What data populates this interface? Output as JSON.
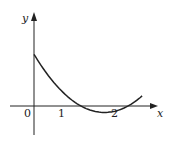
{
  "chart_data": {
    "type": "line",
    "title": "",
    "xlabel": "x",
    "ylabel": "y",
    "origin_label": "0",
    "x_ticks": [
      {
        "value": 1,
        "label": "1"
      },
      {
        "value": 2,
        "label": "2"
      }
    ],
    "y_ticks": [],
    "xlim": [
      -0.5,
      2.6
    ],
    "ylim": [
      -0.65,
      2.0
    ],
    "grid": false,
    "legend": null,
    "series": [
      {
        "name": "f(x)",
        "description": "parabola opening upward, roots at x=1 and x=2, positive y-intercept",
        "x": [
          0,
          0.25,
          0.5,
          0.75,
          1.0,
          1.25,
          1.5,
          1.75,
          2.0,
          2.25,
          2.3
        ],
        "y": [
          1.1,
          0.79,
          0.41,
          0.14,
          0.0,
          -0.1,
          -0.14,
          -0.1,
          0.0,
          0.34,
          0.4
        ]
      }
    ],
    "annotations": []
  },
  "colors": {
    "stroke": "#222222",
    "background": "#ffffff"
  }
}
